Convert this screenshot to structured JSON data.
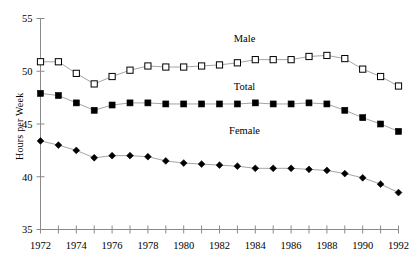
{
  "chart_data": {
    "type": "line",
    "title": "",
    "xlabel": "",
    "ylabel": "Hours per Week",
    "xlim": [
      1972,
      1992
    ],
    "ylim": [
      35,
      55
    ],
    "ytick_values": [
      35,
      40,
      45,
      50,
      55
    ],
    "ytick_labels": [
      "35",
      "40",
      "45",
      "50",
      "55"
    ],
    "xtick_values": [
      1972,
      1973,
      1974,
      1975,
      1976,
      1977,
      1978,
      1979,
      1980,
      1981,
      1982,
      1983,
      1984,
      1985,
      1986,
      1987,
      1988,
      1989,
      1990,
      1991,
      1992
    ],
    "xtick_labels_shown": [
      "1972",
      "",
      "1974",
      "",
      "1976",
      "",
      "1978",
      "",
      "1980",
      "",
      "1982",
      "",
      "1984",
      "",
      "1986",
      "",
      "1988",
      "",
      "1990",
      "",
      "1992"
    ],
    "grid": false,
    "legend_position": "inline-annotations",
    "x": [
      1972,
      1973,
      1974,
      1975,
      1976,
      1977,
      1978,
      1979,
      1980,
      1981,
      1982,
      1983,
      1984,
      1985,
      1986,
      1987,
      1988,
      1989,
      1990,
      1991,
      1992
    ],
    "series": [
      {
        "name": "Male",
        "marker": "open-square",
        "color": "#000000",
        "values": [
          50.9,
          50.9,
          49.8,
          48.8,
          49.5,
          50.1,
          50.5,
          50.4,
          50.4,
          50.5,
          50.6,
          50.8,
          51.1,
          51.1,
          51.1,
          51.4,
          51.5,
          51.2,
          50.2,
          49.5,
          48.6
        ]
      },
      {
        "name": "Total",
        "marker": "filled-square",
        "color": "#000000",
        "values": [
          47.9,
          47.7,
          47.0,
          46.3,
          46.8,
          47.0,
          47.0,
          46.9,
          46.9,
          46.9,
          46.9,
          46.9,
          47.0,
          46.9,
          46.9,
          47.0,
          46.9,
          46.3,
          45.6,
          45.0,
          44.3
        ]
      },
      {
        "name": "Female",
        "marker": "filled-diamond",
        "color": "#000000",
        "values": [
          43.4,
          43.0,
          42.5,
          41.8,
          42.0,
          42.0,
          41.9,
          41.5,
          41.3,
          41.2,
          41.1,
          41.0,
          40.8,
          40.8,
          40.8,
          40.7,
          40.6,
          40.3,
          39.9,
          39.3,
          38.5
        ]
      }
    ],
    "annotations": [
      {
        "text": "Male",
        "x": 1983.4,
        "y": 53.0
      },
      {
        "text": "Total",
        "x": 1983.4,
        "y": 48.4
      },
      {
        "text": "Female",
        "x": 1983.4,
        "y": 44.2
      }
    ]
  }
}
